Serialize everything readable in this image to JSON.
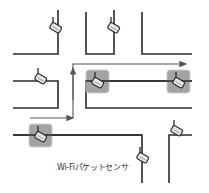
{
  "diagram": {
    "label": "Wi-Fiパケットセンサ",
    "colors": {
      "street_line": "#2b2b2b",
      "arrow": "#555555",
      "highlight_box_fill": "#9a9a9a",
      "highlight_box_stroke": "#c8c8c8",
      "sensor_fill": "#e6e6e6",
      "sensor_stroke": "#2b2b2b"
    },
    "sensors": [
      {
        "id": "sensor-1",
        "x": 55,
        "y": 28,
        "highlighted": false
      },
      {
        "id": "sensor-2",
        "x": 113,
        "y": 28,
        "highlighted": false
      },
      {
        "id": "sensor-3",
        "x": 40,
        "y": 79,
        "highlighted": false
      },
      {
        "id": "sensor-4",
        "x": 97,
        "y": 81,
        "highlighted": true
      },
      {
        "id": "sensor-5",
        "x": 178,
        "y": 81,
        "highlighted": true
      },
      {
        "id": "sensor-6",
        "x": 40,
        "y": 135,
        "highlighted": true
      },
      {
        "id": "sensor-7",
        "x": 141,
        "y": 158,
        "highlighted": false
      },
      {
        "id": "sensor-8",
        "x": 175,
        "y": 131,
        "highlighted": false
      }
    ],
    "route_arrow": {
      "points": [
        [
          30,
          118
        ],
        [
          73,
          118
        ],
        [
          73,
          64
        ],
        [
          187,
          64
        ]
      ],
      "direction": "right"
    }
  }
}
